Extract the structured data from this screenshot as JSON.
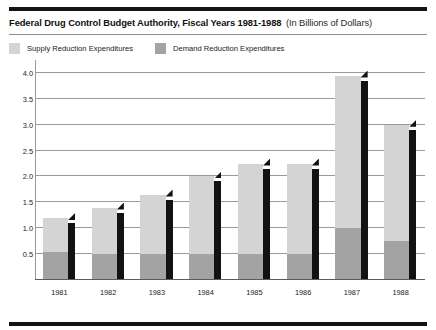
{
  "title": {
    "main": "Federal Drug Control Budget Authority, Fiscal Years 1981-1988",
    "sub": "(In Billions of Dollars)"
  },
  "legend": {
    "items": [
      {
        "label": "Supply Reduction Expenditures",
        "color": "#d4d4d4",
        "key": "supply"
      },
      {
        "label": "Demand Reduction Expenditures",
        "color": "#a3a3a3",
        "key": "demand"
      }
    ]
  },
  "chart_data": {
    "type": "bar",
    "stacked": true,
    "title": "Federal Drug Control Budget Authority, Fiscal Years 1981-1988 (In Billions of Dollars)",
    "xlabel": "",
    "ylabel": "",
    "unit": "Billions of Dollars",
    "categories": [
      "1981",
      "1982",
      "1983",
      "1984",
      "1985",
      "1986",
      "1987",
      "1988"
    ],
    "series": [
      {
        "name": "Demand Reduction Expenditures",
        "color": "#a3a3a3",
        "values": [
          0.55,
          0.5,
          0.5,
          0.5,
          0.5,
          0.5,
          1.0,
          0.75
        ]
      },
      {
        "name": "Supply Reduction Expenditures",
        "color": "#d4d4d4",
        "values": [
          0.65,
          0.9,
          1.15,
          1.5,
          1.75,
          1.75,
          2.95,
          2.25
        ]
      }
    ],
    "totals": [
      1.2,
      1.4,
      1.65,
      2.0,
      2.25,
      2.25,
      3.95,
      3.0
    ],
    "yticks": [
      0.5,
      1.0,
      1.5,
      2.0,
      2.5,
      3.0,
      3.5,
      4.0
    ],
    "ytick_labels": [
      "0.5",
      "1.0",
      "1.5",
      "2.0",
      "2.5",
      "3.0",
      "3.5",
      "4.0"
    ],
    "ylim": [
      0,
      4.25
    ],
    "grid": true,
    "legend_position": "top-left"
  }
}
